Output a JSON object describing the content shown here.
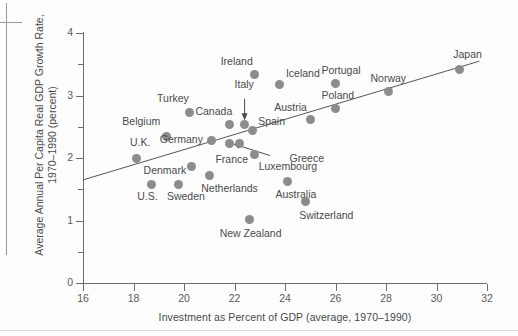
{
  "figure": {
    "title": "",
    "x_axis_title": "Investment as Percent of GDP (average, 1970–1990)",
    "y_axis_title_line1": "Average Annual Per Capita Real GDP Growth Rate,",
    "y_axis_title_line2": "1970–1990 (percent)",
    "dot_color": "#8c8c8c",
    "axis_color": "#6d6d6d",
    "text_color": "#4a4a4a"
  },
  "chart_data": {
    "type": "scatter",
    "title": "",
    "xlabel": "Investment as Percent of GDP (average, 1970–1990)",
    "ylabel": "Average Annual Per Capita Real GDP Growth Rate, 1970–1990 (percent)",
    "xlim": [
      16,
      32
    ],
    "ylim": [
      0,
      4
    ],
    "xticks": [
      16,
      18,
      20,
      22,
      24,
      26,
      28,
      30,
      32
    ],
    "yticks": [
      0,
      1,
      2,
      3,
      4
    ],
    "y_minor_ticks": [
      0.5,
      1.5,
      2.5,
      3.5
    ],
    "grid": false,
    "legend": "none",
    "trendline": {
      "type": "linear",
      "x_start": 16.0,
      "y_start": 1.65,
      "x_end": 31.7,
      "y_end": 3.55
    },
    "points": [
      {
        "label": "U.K.",
        "x": 18.1,
        "y": 2.0,
        "label_dx": -6,
        "label_dy": -16,
        "anchor": "start"
      },
      {
        "label": "Belgium",
        "x": 19.3,
        "y": 2.35,
        "label_dx": -44,
        "label_dy": -15,
        "anchor": "start"
      },
      {
        "label": "Denmark",
        "x": 20.3,
        "y": 1.86,
        "label_dx": -48,
        "label_dy": 3,
        "anchor": "start"
      },
      {
        "label": "U.S.",
        "x": 18.7,
        "y": 1.58,
        "label_dx": -14,
        "label_dy": 12,
        "anchor": "start"
      },
      {
        "label": "Sweden",
        "x": 19.8,
        "y": 1.58,
        "label_dx": -12,
        "label_dy": 12,
        "anchor": "start"
      },
      {
        "label": "Turkey",
        "x": 20.2,
        "y": 2.73,
        "label_dx": -32,
        "label_dy": -14,
        "anchor": "start"
      },
      {
        "label": "Germany",
        "x": 21.1,
        "y": 2.28,
        "label_dx": -52,
        "label_dy": -2,
        "anchor": "start"
      },
      {
        "label": "Netherlands",
        "x": 21.0,
        "y": 1.72,
        "label_dx": -8,
        "label_dy": 12,
        "anchor": "start"
      },
      {
        "label": "Canada",
        "x": 21.8,
        "y": 2.54,
        "label_dx": -34,
        "label_dy": -13,
        "anchor": "start"
      },
      {
        "label": "Italy",
        "x": 22.4,
        "y": 2.54,
        "label_dx": -10,
        "label_dy": -40,
        "anchor": "start"
      },
      {
        "label": "Spain",
        "x": 22.7,
        "y": 2.44,
        "label_dx": 6,
        "label_dy": -10,
        "anchor": "start"
      },
      {
        "label": "France",
        "x": 21.8,
        "y": 2.24,
        "label_dx": -14,
        "label_dy": 16,
        "anchor": "start"
      },
      {
        "label": "Greece",
        "x": 22.2,
        "y": 2.23,
        "label_dx": 50,
        "label_dy": 14,
        "anchor": "start"
      },
      {
        "label": "Ireland",
        "x": 22.8,
        "y": 3.34,
        "label_dx": -34,
        "label_dy": -13,
        "anchor": "start"
      },
      {
        "label": "Iceland",
        "x": 23.8,
        "y": 3.18,
        "label_dx": 6,
        "label_dy": -11,
        "anchor": "start"
      },
      {
        "label": "New Zealand",
        "x": 22.6,
        "y": 1.01,
        "label_dx": -30,
        "label_dy": 13,
        "anchor": "start"
      },
      {
        "label": "Luxembourg",
        "x": 22.8,
        "y": 2.06,
        "label_dx": 4,
        "label_dy": 12,
        "anchor": "start"
      },
      {
        "label": "Austria",
        "x": 25.0,
        "y": 2.62,
        "label_dx": -36,
        "label_dy": -12,
        "anchor": "start"
      },
      {
        "label": "Australia",
        "x": 24.1,
        "y": 1.63,
        "label_dx": -12,
        "label_dy": 13,
        "anchor": "start"
      },
      {
        "label": "Switzerland",
        "x": 24.8,
        "y": 1.3,
        "label_dx": -6,
        "label_dy": 13,
        "anchor": "start"
      },
      {
        "label": "Portugal",
        "x": 26.0,
        "y": 3.2,
        "label_dx": -14,
        "label_dy": -13,
        "anchor": "start"
      },
      {
        "label": "Poland",
        "x": 26.0,
        "y": 2.8,
        "label_dx": -14,
        "label_dy": -13,
        "anchor": "start"
      },
      {
        "label": "Norway",
        "x": 28.1,
        "y": 3.06,
        "label_dx": -18,
        "label_dy": -14,
        "anchor": "start"
      },
      {
        "label": "Japan",
        "x": 30.9,
        "y": 3.42,
        "label_dx": -6,
        "label_dy": -15,
        "anchor": "start"
      }
    ],
    "annotations": [
      {
        "name": "italy-arrow",
        "from_x": 22.4,
        "from_y": 2.95,
        "to_x": 22.4,
        "to_y": 2.62
      },
      {
        "name": "greece-arrow",
        "from_x": 23.4,
        "from_y": 2.04,
        "to_x": 22.0,
        "to_y": 2.22
      }
    ]
  }
}
